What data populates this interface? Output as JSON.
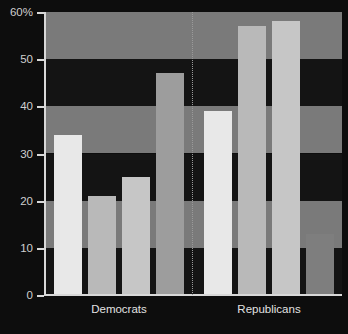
{
  "chart_data": {
    "type": "bar",
    "title": "",
    "xlabel": "",
    "ylabel": "",
    "ylim": [
      0,
      60
    ],
    "ytick_values": [
      0,
      10,
      20,
      30,
      40,
      50,
      60
    ],
    "ytick_labels": [
      "0",
      "10",
      "20",
      "30",
      "40",
      "50",
      "60%"
    ],
    "grid": "horizontal-bands",
    "legend": "none",
    "categories": [
      "Democrats",
      "Republicans"
    ],
    "groups": [
      {
        "name": "Democrats",
        "bars": [
          {
            "index": 1,
            "value": 34,
            "color": "#e8e8e8"
          },
          {
            "index": 2,
            "value": 21,
            "color": "#b9b9b9"
          },
          {
            "index": 3,
            "value": 25,
            "color": "#c6c6c6"
          },
          {
            "index": 4,
            "value": 47,
            "color": "#9d9d9d"
          }
        ]
      },
      {
        "name": "Republicans",
        "bars": [
          {
            "index": 1,
            "value": 39,
            "color": "#e8e8e8"
          },
          {
            "index": 2,
            "value": 57,
            "color": "#b9b9b9"
          },
          {
            "index": 3,
            "value": 58,
            "color": "#c6c6c6"
          },
          {
            "index": 4,
            "value": 13,
            "color": "#7e7e7e"
          }
        ]
      }
    ],
    "series_flat": {
      "labels": [
        "D1",
        "D2",
        "D3",
        "D4",
        "R1",
        "R2",
        "R3",
        "R4"
      ],
      "values": [
        34,
        21,
        25,
        47,
        39,
        57,
        58,
        13
      ]
    },
    "divider": {
      "present": true,
      "style": "dotted",
      "between": [
        "Democrats",
        "Republicans"
      ]
    }
  },
  "axis": {
    "y_label_60": "60%",
    "y_label_50": "50",
    "y_label_40": "40",
    "y_label_30": "30",
    "y_label_20": "20",
    "y_label_10": "10",
    "y_label_0": "0"
  },
  "labels": {
    "group_left": "Democrats",
    "group_right": "Republicans"
  },
  "colors": {
    "background": "#0d0d0d",
    "band_light": "#7a7a7a",
    "band_dark": "#141414",
    "axis": "#d8d8d8",
    "text": "#cfcfcf",
    "divider": "#9a9a9a"
  }
}
